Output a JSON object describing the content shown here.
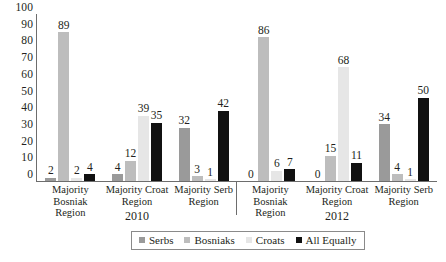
{
  "chart_data": {
    "type": "bar",
    "title": "",
    "xlabel": "",
    "ylabel": "",
    "ylim": [
      0,
      100
    ],
    "yticks": [
      100,
      90,
      80,
      70,
      60,
      50,
      40,
      30,
      20,
      10,
      0
    ],
    "grid": false,
    "legend_position": "bottom-center",
    "categories": [
      "Majority Bosniak Region",
      "Majority Croat Region",
      "Majority Serb Region",
      "Majority Bosniak Region",
      "Majority Croat Region",
      "Majority Serb Region"
    ],
    "category_lines": [
      [
        "Majority",
        "Bosniak Region"
      ],
      [
        "Majority Croat",
        "Region"
      ],
      [
        "Majority Serb",
        "Region"
      ],
      [
        "Majority",
        "Bosniak Region"
      ],
      [
        "Majority Croat",
        "Region"
      ],
      [
        "Majority Serb",
        "Region"
      ]
    ],
    "panels": [
      {
        "label": "2010",
        "span": 3
      },
      {
        "label": "2012",
        "span": 3
      }
    ],
    "series": [
      {
        "name": "Serbs",
        "color": "#9a9a9a",
        "values": [
          2,
          4,
          32,
          0,
          0,
          34
        ]
      },
      {
        "name": "Bosniaks",
        "color": "#bdbdbd",
        "values": [
          89,
          12,
          3,
          86,
          15,
          4
        ]
      },
      {
        "name": "Croats",
        "color": "#e6e6e6",
        "values": [
          2,
          39,
          1,
          6,
          68,
          1
        ]
      },
      {
        "name": "All Equally",
        "color": "#111111",
        "values": [
          4,
          35,
          42,
          7,
          11,
          50
        ]
      }
    ]
  }
}
